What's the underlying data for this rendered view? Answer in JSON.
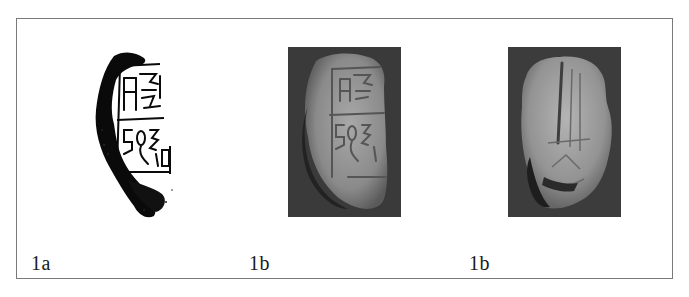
{
  "figure": {
    "panels": [
      {
        "id": "rubbing",
        "type": "ink-rubbing",
        "label": "1a",
        "icon": "seal-rubbing-image"
      },
      {
        "id": "photo-front",
        "type": "photograph",
        "label": "1b",
        "icon": "seal-front-photo"
      },
      {
        "id": "photo-back",
        "type": "photograph",
        "label": "1b",
        "icon": "seal-back-photo"
      }
    ],
    "colors": {
      "frame": "#7a7a7a",
      "photo_background": "#3a3a3a",
      "ink": "#0a0a0a",
      "label_text": "#1a1a1a"
    }
  }
}
